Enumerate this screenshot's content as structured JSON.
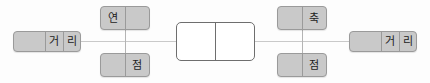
{
  "diagram": {
    "colors": {
      "node_fill": "#c9c9c9",
      "node_border": "#9a9a9a",
      "center_fill": "#ffffff",
      "center_border": "#6e6e6e",
      "line": "#c9c9c9",
      "vline": "#b4b4b4",
      "background": "#fdfdfd",
      "text": "#1d1d1d"
    },
    "nodes": [
      {
        "id": "node-dist-left",
        "name": "distance-node-left",
        "cells": [
          "",
          "거",
          "리"
        ]
      },
      {
        "id": "node-yeon",
        "name": "yeon-node",
        "cells": [
          "연",
          ""
        ]
      },
      {
        "id": "node-jeom-left",
        "name": "jeom-node-left",
        "cells": [
          "",
          "점"
        ]
      },
      {
        "id": "node-center",
        "name": "center-node",
        "cells": [
          "",
          ""
        ]
      },
      {
        "id": "node-chuk",
        "name": "chuk-node",
        "cells": [
          "",
          "축"
        ]
      },
      {
        "id": "node-jeom-right",
        "name": "jeom-node-right",
        "cells": [
          "",
          "점"
        ]
      },
      {
        "id": "node-dist-right",
        "name": "distance-node-right",
        "cells": [
          "",
          "거",
          "리"
        ]
      }
    ],
    "edges": [
      {
        "id": "edge-left",
        "name": "connector-left-horizontal",
        "orientation": "horizontal"
      },
      {
        "id": "edge-right",
        "name": "connector-right-horizontal",
        "orientation": "horizontal"
      },
      {
        "id": "edge-yeon-jeom",
        "name": "connector-yeon-jeom-vertical",
        "orientation": "vertical"
      },
      {
        "id": "edge-chuk-jeom",
        "name": "connector-chuk-jeom-vertical",
        "orientation": "vertical"
      }
    ]
  }
}
